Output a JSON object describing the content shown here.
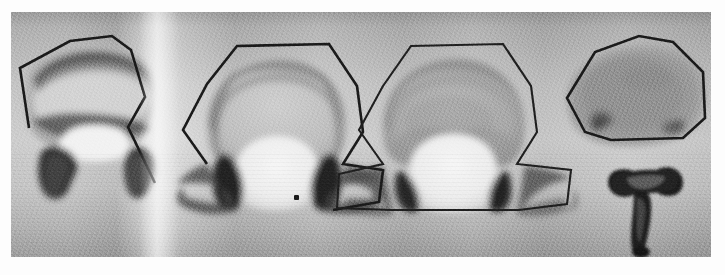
{
  "figure": {
    "kind": "photographic-plate",
    "medium": "grayscale radiograph photograph with hand-drawn tracing outlines",
    "panel_count": 4,
    "background_color": "#b9b9b9",
    "outline_color": "#1a1a1a",
    "bone_light_color": "#efefef",
    "bone_mid_color": "#a9a9a9",
    "bone_dark_color": "#3a3a3a",
    "plate": {
      "x": 11,
      "y": 12,
      "width": 700,
      "height": 245
    }
  },
  "specimens": [
    {
      "index": 1,
      "label": "",
      "description": "vertebra with broad flattened body, dark arc-shaped cortical band across the top of the centrum and a second dark band beneath it; left and right pedicle/transverse processes descend as dark hooked wings; tracing is an open polygon following the superior border and the right transverse process",
      "outline_type": "open-polygon",
      "centroid": {
        "x": 82,
        "y": 105
      },
      "shading": {
        "top_band": "dark",
        "mid": "light",
        "lower_band": "dark",
        "wings": "very dark"
      }
    },
    {
      "index": 2,
      "label": "",
      "description": "vertebra with tall dome-shaped body; hexagonal tracing encloses the dome and continues out along both transverse processes; neural canal appears as a bright pale dome at the bottom centre flanked by very dark pedicles",
      "outline_type": "closed-hexagon-with-wings",
      "centroid": {
        "x": 265,
        "y": 100
      },
      "shading": {
        "dome": "mid grey",
        "rim": "dark",
        "canal": "bright",
        "pedicles": "very dark"
      }
    },
    {
      "index": 3,
      "label": "",
      "description": "vertebra similar to specimen 2 but with a paler, more uniformly grey body and straighter, flatter transverse process wings; tracing is a closed polygon wrapping body and both wings",
      "outline_type": "closed-polygon-with-flat-wings",
      "centroid": {
        "x": 440,
        "y": 100
      },
      "shading": {
        "dome": "light grey",
        "rim": "mid",
        "canal": "bright",
        "pedicles": "very dark"
      }
    },
    {
      "index": 4,
      "label": "",
      "description": "isolated vertebral body (centrum) in oval form with two darker mottled patches, traced by a heptagonal outline; a separate detached T-shaped neural arch / spinous process lies below it",
      "outline_type": "closed-heptagon",
      "centroid": {
        "x": 620,
        "y": 85
      },
      "extra_element": {
        "name": "detached-neural-arch",
        "shape": "T-shaped",
        "centroid": {
          "x": 637,
          "y": 198
        }
      },
      "shading": {
        "body": "mid grey mottled",
        "spots": "dark",
        "arch": "very dark"
      }
    }
  ],
  "artifacts": [
    {
      "name": "dust-speck",
      "x": 283,
      "y": 183,
      "size_px": 4
    },
    {
      "name": "vertical-light-streak",
      "x": 148,
      "y": 130,
      "note": "bright film band between specimen 1 and 2"
    }
  ],
  "annotations": {
    "text_labels": [],
    "scale_bar": null,
    "caption": ""
  }
}
